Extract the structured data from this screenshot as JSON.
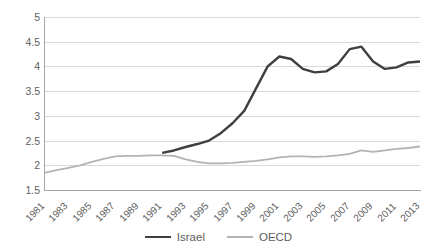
{
  "chart_data": {
    "type": "line",
    "title": "",
    "subtitle": "",
    "xlabel": "",
    "ylabel": "",
    "ylim": [
      1.5,
      5
    ],
    "y_ticks": [
      "1.5",
      "2",
      "2.5",
      "3",
      "3.5",
      "4",
      "4.5",
      "5"
    ],
    "grid": true,
    "legend_position": "bottom",
    "x": [
      1981,
      1982,
      1983,
      1984,
      1985,
      1986,
      1987,
      1988,
      1989,
      1990,
      1991,
      1992,
      1993,
      1994,
      1995,
      1996,
      1997,
      1998,
      1999,
      2000,
      2001,
      2002,
      2003,
      2004,
      2005,
      2006,
      2007,
      2008,
      2009,
      2010,
      2011,
      2012,
      2013
    ],
    "x_tick_labels": [
      "1981",
      "1983",
      "1985",
      "1987",
      "1989",
      "1991",
      "1993",
      "1995",
      "1997",
      "1999",
      "2001",
      "2003",
      "2005",
      "2007",
      "2009",
      "2011",
      "2013"
    ],
    "series": [
      {
        "name": "Israel",
        "color": "#3f3f3f",
        "width": 2.4,
        "values": [
          null,
          null,
          null,
          null,
          null,
          null,
          null,
          null,
          null,
          null,
          2.25,
          2.3,
          2.37,
          2.43,
          2.5,
          2.65,
          2.85,
          3.1,
          3.55,
          4.0,
          4.2,
          4.15,
          3.95,
          3.88,
          3.9,
          4.05,
          4.35,
          4.4,
          4.1,
          3.95,
          3.98,
          4.08,
          4.1
        ]
      },
      {
        "name": "OECD",
        "color": "#b3b3b3",
        "width": 1.8,
        "values": [
          1.85,
          1.9,
          1.95,
          2.0,
          2.07,
          2.13,
          2.18,
          2.19,
          2.19,
          2.2,
          2.2,
          2.19,
          2.12,
          2.07,
          2.04,
          2.04,
          2.05,
          2.07,
          2.09,
          2.12,
          2.16,
          2.18,
          2.18,
          2.17,
          2.18,
          2.2,
          2.23,
          2.3,
          2.27,
          2.3,
          2.33,
          2.35,
          2.38
        ]
      }
    ]
  },
  "legend": {
    "items": [
      {
        "label": "Israel",
        "color": "#3f3f3f"
      },
      {
        "label": "OECD",
        "color": "#b3b3b3"
      }
    ]
  }
}
